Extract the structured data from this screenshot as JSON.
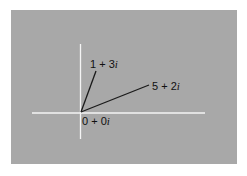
{
  "diagram": {
    "title": "",
    "background_color": "#a8a8a8",
    "axis_color": "#f4f4f4",
    "vector_color": "#1a1a1a",
    "origin": {
      "label_real": "0",
      "label_op": "+",
      "label_imag": "0",
      "label_unit": "i",
      "re": 0,
      "im": 0
    },
    "vectors": [
      {
        "label_real": "1",
        "label_op": "+",
        "label_imag": "3",
        "label_unit": "i",
        "re": 1,
        "im": 3
      },
      {
        "label_real": "5",
        "label_op": "+",
        "label_imag": "2",
        "label_unit": "i",
        "re": 5,
        "im": 2
      }
    ]
  }
}
